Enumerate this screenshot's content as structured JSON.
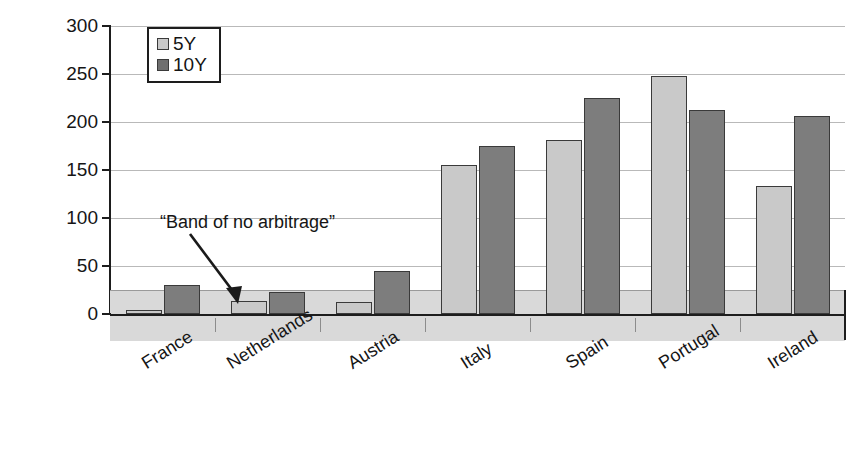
{
  "chart_data": {
    "type": "bar",
    "title": "",
    "xlabel": "",
    "ylabel": "Total pick-up in bp (adjusted)",
    "categories": [
      "France",
      "Netherlands",
      "Austria",
      "Italy",
      "Spain",
      "Portugal",
      "Ireland"
    ],
    "series": [
      {
        "name": "5Y",
        "values": [
          4,
          14,
          12,
          155,
          181,
          248,
          133
        ],
        "color": "#c9c9c9"
      },
      {
        "name": "10Y",
        "values": [
          30,
          23,
          45,
          175,
          225,
          213,
          206
        ],
        "color": "#7d7d7d"
      }
    ],
    "ylim": [
      0,
      300
    ],
    "yticks": [
      0,
      50,
      100,
      150,
      200,
      250,
      300
    ],
    "ytick_labels": [
      "0",
      "50",
      "100",
      "150",
      "200",
      "250",
      "300"
    ],
    "grid": true,
    "legend_position": "top-left",
    "annotations": [
      {
        "text": "“Band of no arbitrage”",
        "type": "band-callout",
        "band_range": [
          0,
          25
        ]
      }
    ]
  },
  "legend": {
    "items": [
      {
        "label": "5Y",
        "swatch": "legend-swatch-5y"
      },
      {
        "label": "10Y",
        "swatch": "legend-swatch-10y"
      }
    ]
  },
  "axis": {
    "y_title": "Total pick-up in bp (adjusted)",
    "y_ticks": [
      "300",
      "250",
      "200",
      "150",
      "100",
      "50",
      "0"
    ]
  },
  "annotation": {
    "band_label": "“Band of no arbitrage”"
  },
  "x_labels": [
    "France",
    "Netherlands",
    "Austria",
    "Italy",
    "Spain",
    "Portugal",
    "Ireland"
  ]
}
